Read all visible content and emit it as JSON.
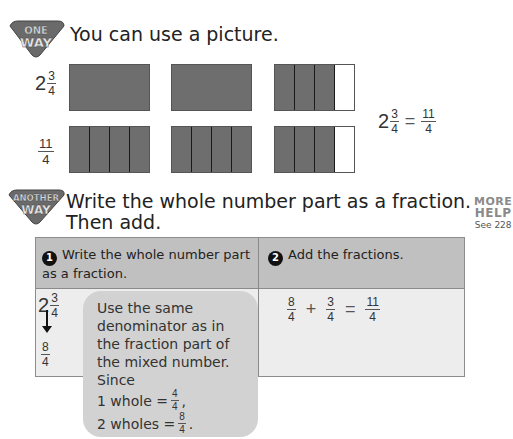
{
  "section1": {
    "badge": {
      "line1": "ONE",
      "line2": "WAY",
      "icon": "one-way-badge"
    },
    "heading": "You can use a picture.",
    "rows": [
      {
        "label": {
          "whole": "2",
          "num": "3",
          "den": "4"
        },
        "models": [
          {
            "parts": 1,
            "shaded": 1
          },
          {
            "parts": 1,
            "shaded": 1
          },
          {
            "parts": 4,
            "shaded": 3
          }
        ]
      },
      {
        "label": {
          "num": "11",
          "den": "4"
        },
        "models": [
          {
            "parts": 4,
            "shaded": 4
          },
          {
            "parts": 4,
            "shaded": 4
          },
          {
            "parts": 4,
            "shaded": 3
          }
        ]
      }
    ],
    "equation": {
      "whole": "2",
      "num": "3",
      "den": "4",
      "equals": "=",
      "rhs_num": "11",
      "rhs_den": "4"
    }
  },
  "section2": {
    "badge": {
      "line1": "ANOTHER",
      "line2": "WAY",
      "icon": "another-way-badge"
    },
    "heading_line1": "Write the whole number part as a fraction.",
    "heading_line2": "Then add.",
    "more_help": {
      "line1": "MORE",
      "line2": "HELP",
      "line3": "See 228"
    },
    "table": {
      "columns": [
        {
          "step": "1",
          "title": "Write the whole number part as a fraction."
        },
        {
          "step": "2",
          "title": "Add the fractions."
        }
      ],
      "col1": {
        "whole": "2",
        "num": "3",
        "den": "4",
        "arrow": "down-arrow",
        "result_num": "8",
        "result_den": "4"
      },
      "col2": {
        "a_num": "8",
        "a_den": "4",
        "plus": "+",
        "b_num": "3",
        "b_den": "4",
        "equals": "=",
        "r_num": "11",
        "r_den": "4"
      }
    },
    "callout": {
      "lines": [
        "Use the same",
        "denominator as in",
        "the fraction part of",
        "the mixed number.",
        "Since"
      ],
      "eq1": {
        "text": "1 whole =",
        "num": "4",
        "den": "4",
        "punct": ","
      },
      "eq2": {
        "text": "2 wholes =",
        "num": "8",
        "den": "4",
        "punct": "."
      }
    }
  },
  "colors": {
    "shaded": "#6e6e6e",
    "header_bg": "#c0c0c0",
    "body_bg": "#ededed",
    "callout_bg": "#d2d2d2",
    "badge": "#6a6a6a",
    "more_help": "#8a8a8a"
  }
}
